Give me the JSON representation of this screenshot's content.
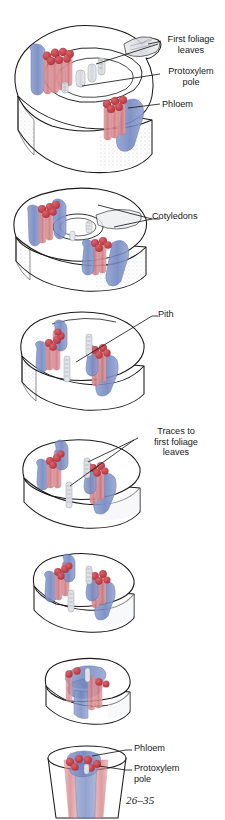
{
  "figure": {
    "number": "26–35",
    "background_color": "#ffffff"
  },
  "colors": {
    "phloem_blue": "#7b8fc4",
    "phloem_blue_dark": "#5a6ead",
    "xylem_red": "#d98a8f",
    "protoxylem_red": "#c03a44",
    "outline": "#1a1a1a",
    "pith_grey": "#c9ccd2",
    "stipple_grey": "#b9bcc2"
  },
  "panels": [
    {
      "id": "panel-1",
      "name": "shoot-apex-section",
      "labels": [
        {
          "id": "first-foliage-leaves",
          "text": "First foliage\nleaves"
        },
        {
          "id": "protoxylem-pole",
          "text": "Protoxylem\npole"
        },
        {
          "id": "phloem",
          "text": "Phloem"
        }
      ]
    },
    {
      "id": "panel-2",
      "name": "cotyledon-node-section",
      "labels": [
        {
          "id": "cotyledons",
          "text": "Cotyledons"
        }
      ]
    },
    {
      "id": "panel-3",
      "name": "upper-hypocotyl-section",
      "labels": [
        {
          "id": "pith",
          "text": "Pith"
        }
      ]
    },
    {
      "id": "panel-4",
      "name": "mid-hypocotyl-section",
      "labels": [
        {
          "id": "traces-to-first-foliage-leaves",
          "text": "Traces to\nfirst foliage\nleaves"
        }
      ]
    },
    {
      "id": "panel-5",
      "name": "lower-hypocotyl-section",
      "labels": []
    },
    {
      "id": "panel-6",
      "name": "transition-zone-section",
      "labels": []
    },
    {
      "id": "panel-7",
      "name": "root-section",
      "labels": [
        {
          "id": "phloem",
          "text": "Phloem"
        },
        {
          "id": "protoxylem-pole",
          "text": "Protoxylem\npole"
        }
      ]
    }
  ]
}
